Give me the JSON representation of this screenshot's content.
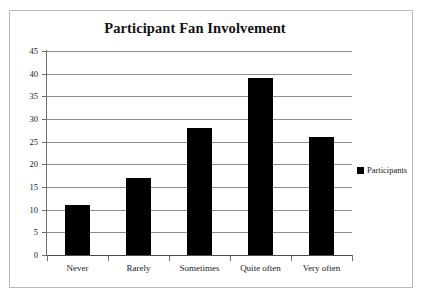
{
  "chart_data": {
    "type": "bar",
    "title": "Participant Fan Involvement",
    "xlabel": "",
    "ylabel": "",
    "categories": [
      "Never",
      "Rarely",
      "Sometimes",
      "Quite often",
      "Very often"
    ],
    "series": [
      {
        "name": "Participants",
        "values": [
          11,
          17,
          28,
          39,
          26
        ],
        "color": "#000000"
      }
    ],
    "ylim": [
      0,
      45
    ],
    "ytick_step": 5,
    "yticks": [
      0,
      5,
      10,
      15,
      20,
      25,
      30,
      35,
      40,
      45
    ],
    "ytick_labels": [
      "0",
      "5",
      "10",
      "15",
      "20",
      "25",
      "30",
      "35",
      "40",
      "45"
    ],
    "grid": true,
    "grid_axis": "y",
    "legend": {
      "position": "right",
      "entries": [
        {
          "label": "Participants",
          "marker": "filled-square",
          "color": "#000000"
        }
      ]
    },
    "background_color": "#ffffff",
    "frame_color": "#b9b9b9"
  }
}
